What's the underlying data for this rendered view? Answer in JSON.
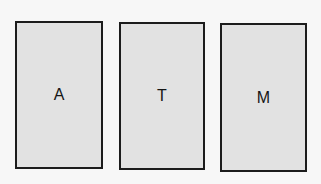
{
  "cards": [
    {
      "label": "A"
    },
    {
      "label": "T"
    },
    {
      "label": "M"
    }
  ]
}
